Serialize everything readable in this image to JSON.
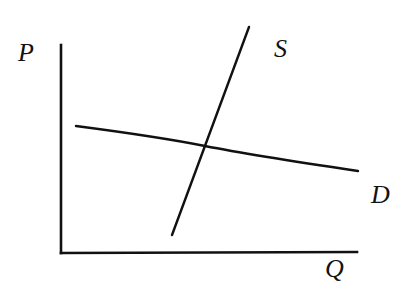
{
  "diagram": {
    "type": "supply-demand",
    "labels": {
      "price_axis": "P",
      "quantity_axis": "Q",
      "supply_curve": "S",
      "demand_curve": "D"
    },
    "colors": {
      "ink": "#111111",
      "background": "#ffffff"
    },
    "geometry": {
      "origin": [
        61,
        253
      ],
      "p_axis_top": [
        61,
        45
      ],
      "q_axis_end": [
        357,
        253
      ],
      "supply": {
        "start": [
          172,
          235
        ],
        "end": [
          249,
          27
        ]
      },
      "demand": {
        "start": [
          76,
          126
        ],
        "end": [
          358,
          171
        ]
      },
      "equilibrium": [
        205,
        146
      ]
    }
  }
}
